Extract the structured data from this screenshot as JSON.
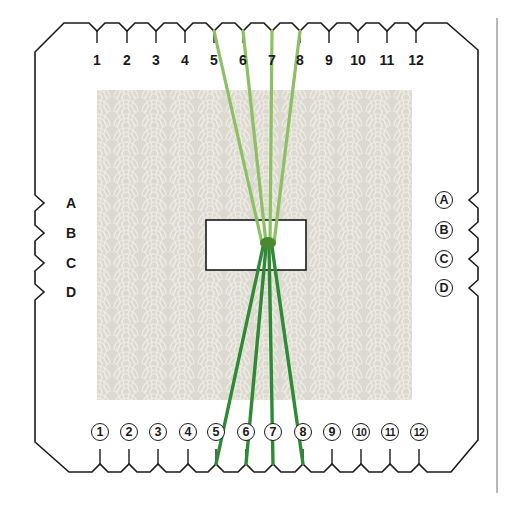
{
  "diagram": {
    "colors": {
      "outline": "#1a1a1a",
      "pattern_bg": "#dcdad0",
      "pattern_line": "#eeece4",
      "strand_light": "#8cc063",
      "strand_dark": "#2f8a36",
      "knot": "#4a8a2e",
      "divider": "#b8b8b8"
    },
    "top_slots": [
      {
        "label": "1",
        "x": 97
      },
      {
        "label": "2",
        "x": 127
      },
      {
        "label": "3",
        "x": 156
      },
      {
        "label": "4",
        "x": 185
      },
      {
        "label": "5",
        "x": 214
      },
      {
        "label": "6",
        "x": 243
      },
      {
        "label": "7",
        "x": 272
      },
      {
        "label": "8",
        "x": 300
      },
      {
        "label": "9",
        "x": 329
      },
      {
        "label": "10",
        "x": 358
      },
      {
        "label": "11",
        "x": 387
      },
      {
        "label": "12",
        "x": 416
      }
    ],
    "bottom_slots": [
      {
        "label": "1",
        "x": 100
      },
      {
        "label": "2",
        "x": 129
      },
      {
        "label": "3",
        "x": 158
      },
      {
        "label": "4",
        "x": 188
      },
      {
        "label": "5",
        "x": 216
      },
      {
        "label": "6",
        "x": 246
      },
      {
        "label": "7",
        "x": 273
      },
      {
        "label": "8",
        "x": 303
      },
      {
        "label": "9",
        "x": 332
      },
      {
        "label": "10",
        "x": 361
      },
      {
        "label": "11",
        "x": 390
      },
      {
        "label": "12",
        "x": 419
      }
    ],
    "left_slots": [
      {
        "label": "A",
        "y": 203
      },
      {
        "label": "B",
        "y": 233
      },
      {
        "label": "C",
        "y": 263
      },
      {
        "label": "D",
        "y": 292
      }
    ],
    "right_slots": [
      {
        "label": "A",
        "y": 200
      },
      {
        "label": "B",
        "y": 230
      },
      {
        "label": "C",
        "y": 259
      },
      {
        "label": "D",
        "y": 288
      }
    ],
    "center_hole": {
      "x": 206,
      "y": 220,
      "w": 100,
      "h": 50
    },
    "knot": {
      "x": 268,
      "y": 243
    },
    "strands_top_slots": [
      "5",
      "6",
      "7",
      "8"
    ],
    "strands_bottom_slots": [
      "5",
      "6",
      "7",
      "8"
    ]
  }
}
